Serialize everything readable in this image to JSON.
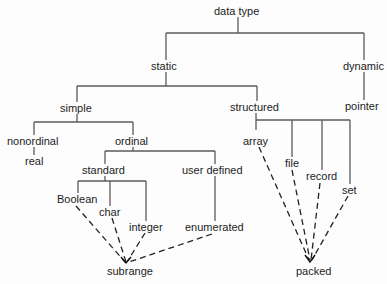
{
  "title": "data type",
  "nodes": {
    "data_type": "data type",
    "static": "static",
    "dynamic": "dynamic",
    "simple": "simple",
    "structured": "structured",
    "pointer": "pointer",
    "nonordinal": "nonordinal",
    "ordinal": "ordinal",
    "real": "real",
    "standard": "standard",
    "user_defined": "user defined",
    "boolean": "Boolean",
    "char": "char",
    "integer": "integer",
    "enumerated": "enumerated",
    "subrange": "subrange",
    "array": "array",
    "file": "file",
    "record": "record",
    "set": "set",
    "packed": "packed"
  },
  "edges_solid": [
    [
      "data type",
      "static"
    ],
    [
      "data type",
      "dynamic"
    ],
    [
      "dynamic",
      "pointer"
    ],
    [
      "static",
      "simple"
    ],
    [
      "static",
      "structured"
    ],
    [
      "simple",
      "nonordinal"
    ],
    [
      "simple",
      "ordinal"
    ],
    [
      "nonordinal",
      "real"
    ],
    [
      "ordinal",
      "standard"
    ],
    [
      "ordinal",
      "user defined"
    ],
    [
      "user defined",
      "enumerated"
    ],
    [
      "standard",
      "Boolean"
    ],
    [
      "standard",
      "char"
    ],
    [
      "standard",
      "integer"
    ],
    [
      "structured",
      "array"
    ],
    [
      "structured",
      "file"
    ],
    [
      "structured",
      "record"
    ],
    [
      "structured",
      "set"
    ]
  ],
  "edges_dashed": [
    [
      "Boolean",
      "subrange"
    ],
    [
      "char",
      "subrange"
    ],
    [
      "integer",
      "subrange"
    ],
    [
      "enumerated",
      "subrange"
    ],
    [
      "array",
      "packed"
    ],
    [
      "file",
      "packed"
    ],
    [
      "record",
      "packed"
    ],
    [
      "set",
      "packed"
    ]
  ],
  "colors": {
    "line": "#555555",
    "text": "#1c1c1c",
    "background": "#fdfdfd"
  }
}
